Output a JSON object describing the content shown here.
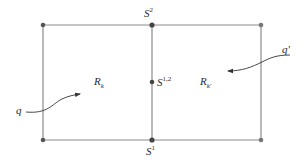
{
  "diagram": {
    "type": "two-adjacent-rectangles",
    "colors": {
      "line": "#8c8c8c",
      "point": "#555555",
      "text": "#2a2a2a"
    },
    "labels": {
      "s2": {
        "base": "S",
        "sup": "2"
      },
      "s1": {
        "base": "S",
        "sup": "1"
      },
      "s12": {
        "base": "S",
        "sup": "1,2"
      },
      "rk": {
        "base": "R",
        "sub": "k"
      },
      "rkp": {
        "base": "R",
        "sub": "k'"
      },
      "q": "q",
      "qp": "q'"
    },
    "points": [
      {
        "name": "top-left",
        "x": 43,
        "y": 25
      },
      {
        "name": "top-middle",
        "x": 152,
        "y": 25
      },
      {
        "name": "top-right",
        "x": 261,
        "y": 25
      },
      {
        "name": "bottom-left",
        "x": 43,
        "y": 140
      },
      {
        "name": "bottom-middle",
        "x": 152,
        "y": 140
      },
      {
        "name": "bottom-right",
        "x": 261,
        "y": 140
      },
      {
        "name": "middle-point-s12",
        "x": 152,
        "y": 82
      }
    ],
    "arrows": [
      {
        "label": "q",
        "from": [
          26,
          112
        ],
        "to": [
          80,
          94
        ]
      },
      {
        "label": "q'",
        "from": [
          290,
          55
        ],
        "to": [
          228,
          71
        ]
      }
    ]
  }
}
